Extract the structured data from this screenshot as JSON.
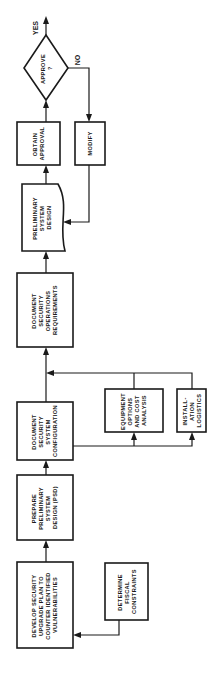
{
  "diagram": {
    "type": "flowchart",
    "orientation": "rotated-90-ccw",
    "nodes": {
      "develop_plan": {
        "lines": [
          "DEVELOP SECURITY",
          "UPGRADE PLAN TO",
          "COUNTER IDENTIFIED",
          "VULNERABILITIES"
        ]
      },
      "fiscal": {
        "lines": [
          "DETERMINE",
          "FISCAL",
          "CONSTRAINTS"
        ]
      },
      "prepare_psd": {
        "lines": [
          "PREPARE",
          "PRELIMINARY",
          "SYSTEM",
          "DESIGN (PSD)"
        ]
      },
      "config": {
        "lines": [
          "DOCUMENT",
          "SECURITY",
          "SYSTEM",
          "CONFIGURATION"
        ]
      },
      "equipment": {
        "lines": [
          "EQUIPMENT",
          "OPTIONS",
          "AND COST",
          "ANALYSIS"
        ]
      },
      "install": {
        "lines": [
          "INSTALL-",
          "ATION",
          "LOGISTICS"
        ]
      },
      "ops_req": {
        "lines": [
          "DOCUMENT",
          "SECURITY",
          "OPERATIONS",
          "REQUIREMENTS"
        ]
      },
      "prelim_design": {
        "lines": [
          "PRELIMINARY",
          "SYSTEM",
          "DESIGN"
        ]
      },
      "obtain_approval": {
        "lines": [
          "OBTAIN",
          "APPROVAL"
        ]
      },
      "modify": {
        "lines": [
          "MODIFY"
        ]
      },
      "approve": {
        "lines": [
          "APPROVE",
          "?"
        ]
      }
    },
    "branch_labels": {
      "yes": "YES",
      "no": "NO"
    },
    "edges": [
      {
        "from": "fiscal",
        "to": "develop_plan"
      },
      {
        "from": "develop_plan",
        "to": "prepare_psd"
      },
      {
        "from": "prepare_psd",
        "to": "config"
      },
      {
        "from": "config",
        "to": "equipment"
      },
      {
        "from": "config",
        "to": "install"
      },
      {
        "from": "equipment",
        "to": "ops_req"
      },
      {
        "from": "install",
        "to": "ops_req"
      },
      {
        "from": "config",
        "to": "ops_req"
      },
      {
        "from": "ops_req",
        "to": "prelim_design"
      },
      {
        "from": "prelim_design",
        "to": "obtain_approval"
      },
      {
        "from": "obtain_approval",
        "to": "approve"
      },
      {
        "from": "approve",
        "to": "end",
        "label": "YES"
      },
      {
        "from": "approve",
        "to": "modify",
        "label": "NO"
      },
      {
        "from": "modify",
        "to": "prelim_design"
      }
    ]
  }
}
